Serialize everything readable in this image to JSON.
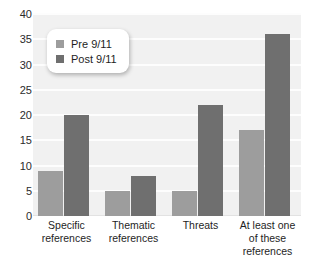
{
  "chart_data": {
    "type": "bar",
    "title": "",
    "subtitle": "",
    "xlabel": "",
    "ylabel": "",
    "ylim": [
      0,
      40
    ],
    "yticks": [
      0,
      5,
      10,
      15,
      20,
      25,
      30,
      35,
      40
    ],
    "grid": true,
    "legend_position": "top-left",
    "categories": [
      "Specific references",
      "Thematic references",
      "Threats",
      "At least one of these references"
    ],
    "category_lines": [
      [
        "Specific",
        "references"
      ],
      [
        "Thematic",
        "references"
      ],
      [
        "Threats"
      ],
      [
        "At least one",
        "of these",
        "references"
      ]
    ],
    "series": [
      {
        "name": "Pre 9/11",
        "color": "#9d9d9d",
        "values": [
          9,
          5,
          5,
          17
        ]
      },
      {
        "name": "Post 9/11",
        "color": "#6f6f6f",
        "values": [
          20,
          8,
          22,
          36
        ]
      }
    ]
  },
  "legend": {
    "items": [
      {
        "label": "Pre 9/11",
        "color": "#9d9d9d"
      },
      {
        "label": "Post 9/11",
        "color": "#6f6f6f"
      }
    ]
  },
  "colors": {
    "plot_background": "#f1f1f1",
    "gridline": "#fdfdfd",
    "page_background": "#ffffff",
    "text": "#1e1e1e",
    "pre_bar": "#9d9d9d",
    "post_bar": "#6f6f6f"
  }
}
